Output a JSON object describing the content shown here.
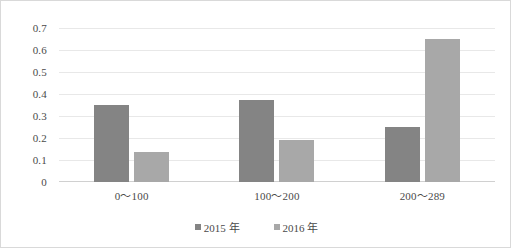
{
  "chart_data": {
    "type": "bar",
    "title": "",
    "xlabel": "",
    "ylabel": "",
    "categories": [
      "0～100",
      "100～200",
      "200～289"
    ],
    "series": [
      {
        "name": "2015 年",
        "values": [
          0.35,
          0.375,
          0.25
        ],
        "color": "#848484"
      },
      {
        "name": "2016 年",
        "values": [
          0.135,
          0.19,
          0.65
        ],
        "color": "#a8a8a8"
      }
    ],
    "ylim": [
      0,
      0.7
    ],
    "ytick_labels": [
      "0.7",
      "0.6",
      "0.5",
      "0.4",
      "0.3",
      "0.2",
      "0.1",
      "0"
    ],
    "ytick_values": [
      0.7,
      0.6,
      0.5,
      0.4,
      0.3,
      0.2,
      0.1,
      0
    ],
    "grid": true,
    "legend_position": "bottom",
    "plot_background": "#ffffff",
    "grid_color": "#e8e8e8",
    "border_color": "#d9d9d9"
  }
}
